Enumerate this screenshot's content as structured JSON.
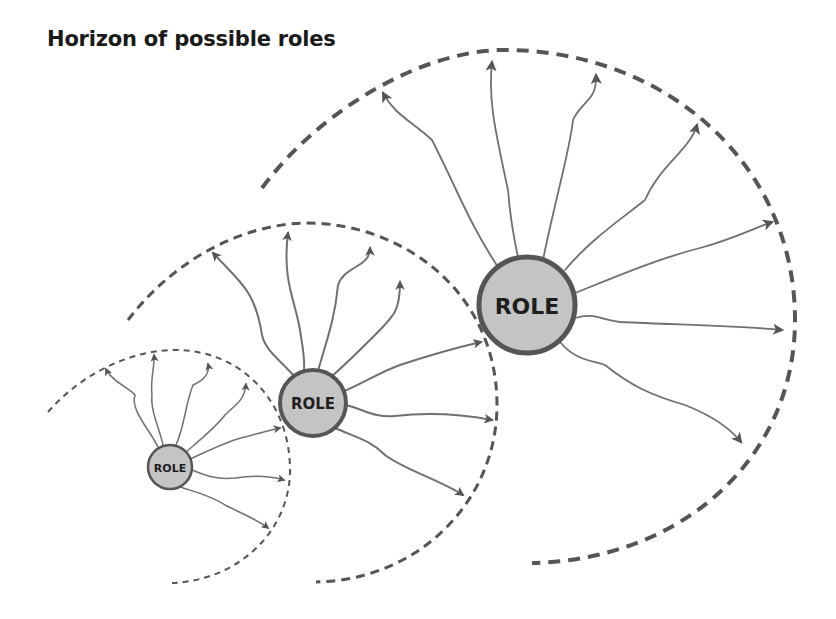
{
  "title": "Horizon of possible roles",
  "colors": {
    "horizon_stroke": "#555555",
    "ray_stroke": "#707070",
    "role_fill": "#c4c4c4",
    "role_stroke": "#555555",
    "label": "#1e1e1e"
  },
  "roles": [
    {
      "id": "small",
      "label": "ROLE",
      "center": [
        170,
        467
      ],
      "radius": 22,
      "font_size": 11,
      "stroke_width": 2.5,
      "horizon": {
        "path": "M 48 412 C 80 375 130 350 175 350 C 240 350 290 400 290 470 C 290 530 240 580 172 583",
        "stroke_width": 2,
        "dash": "6 5"
      },
      "ray_width": 1.5,
      "arrow_size": 5,
      "rays": [
        "M 158 447 C 150 430 130 410 135 395 C 130 388 112 382 106 369",
        "M 163 445 C 160 430 150 410 152 395 C 150 380 155 365 154 355",
        "M 176 445 C 185 425 185 405 193 385 C 205 380 210 372 208 364",
        "M 186 452 C 200 440 215 428 225 415 C 235 405 245 400 246 384",
        "M 190 459 C 210 450 230 440 245 437 C 260 433 270 430 280 428",
        "M 192 470 C 205 475 215 480 235 478 C 255 475 270 476 284 480",
        "M 180 487 C 195 492 210 495 225 505 C 245 515 258 520 268 528"
      ]
    },
    {
      "id": "medium",
      "label": "ROLE",
      "center": [
        313,
        403
      ],
      "radius": 33,
      "font_size": 15,
      "stroke_width": 4,
      "horizon": {
        "path": "M 128 320 C 170 265 235 225 305 223 C 400 222 497 290 497 405 C 497 500 420 580 316 582",
        "stroke_width": 3,
        "dash": "9 6"
      },
      "ray_width": 2,
      "arrow_size": 6,
      "rays": [
        "M 294 376 C 280 360 265 350 262 335 C 255 290 240 282 213 253",
        "M 304 371 C 305 355 302 345 300 330 C 295 300 282 280 288 233",
        "M 318 371 C 325 345 335 320 338 285 C 345 265 370 268 370 248",
        "M 332 376 C 345 365 360 350 375 335 C 395 315 400 310 400 282",
        "M 342 392 C 360 385 380 372 400 365 C 430 355 455 348 481 342",
        "M 346 405 C 365 410 375 418 395 416 C 430 412 460 414 492 420",
        "M 335 428 C 355 437 370 440 385 455 C 405 470 440 480 463 495"
      ]
    },
    {
      "id": "large",
      "label": "ROLE",
      "center": [
        527,
        305
      ],
      "radius": 48,
      "font_size": 22,
      "stroke_width": 5,
      "horizon": {
        "path": "M 262 188 C 320 110 420 52 500 50 C 660 48 795 160 795 320 C 795 460 680 560 532 563",
        "stroke_width": 4,
        "dash": "12 8"
      },
      "ray_width": 1.8,
      "arrow_size": 7,
      "rays": [
        "M 498 267 C 470 225 455 185 432 140 C 410 120 395 115 383 93",
        "M 518 257 C 512 230 510 215 508 190 C 495 130 488 100 492 62",
        "M 543 260 C 555 200 570 150 573 120 C 582 100 597 102 596 75",
        "M 565 270 C 590 240 620 220 645 200 C 660 165 690 150 697 125",
        "M 575 293 C 620 275 660 258 700 248 C 730 240 750 230 772 222",
        "M 575 318 C 595 312 600 320 620 322 C 680 325 730 325 782 330",
        "M 560 342 C 575 360 590 360 605 365 C 630 385 650 395 685 405 C 710 415 730 428 741 442"
      ]
    }
  ]
}
